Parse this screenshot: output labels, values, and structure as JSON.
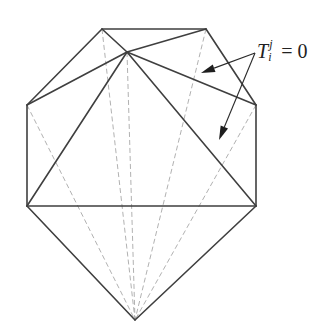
{
  "diagram": {
    "label": {
      "symbol": "T",
      "subscript": "i",
      "superscript": "j",
      "relation": "= 0",
      "full_text": "T_i^j = 0"
    },
    "vertices": {
      "top_left": [
        102,
        29
      ],
      "top_right": [
        206,
        29
      ],
      "apex": [
        127,
        52
      ],
      "left_upper": [
        27,
        105
      ],
      "right_upper": [
        256,
        105
      ],
      "left_lower": [
        27,
        206
      ],
      "right_lower": [
        256,
        206
      ],
      "bottom": [
        135,
        320
      ]
    },
    "solid_edges": [
      [
        "top_left",
        "top_right"
      ],
      [
        "top_left",
        "left_upper"
      ],
      [
        "top_right",
        "right_upper"
      ],
      [
        "top_left",
        "apex"
      ],
      [
        "top_right",
        "apex"
      ],
      [
        "apex",
        "left_upper"
      ],
      [
        "apex",
        "right_upper"
      ],
      [
        "apex",
        "left_lower"
      ],
      [
        "apex",
        "right_lower"
      ],
      [
        "left_upper",
        "left_lower"
      ],
      [
        "right_upper",
        "right_lower"
      ],
      [
        "left_lower",
        "right_lower"
      ],
      [
        "left_lower",
        "bottom"
      ],
      [
        "right_lower",
        "bottom"
      ]
    ],
    "dashed_edges": [
      [
        "left_upper",
        "bottom"
      ],
      [
        "top_left",
        "bottom"
      ],
      [
        "apex",
        "bottom"
      ],
      [
        "top_right",
        "bottom"
      ],
      [
        "right_upper",
        "bottom"
      ]
    ],
    "arrows": [
      {
        "from": [
          255,
          53
        ],
        "to": [
          201,
          73
        ]
      },
      {
        "from": [
          255,
          53
        ],
        "to": [
          219,
          140
        ]
      }
    ],
    "colors": {
      "background": "#ffffff",
      "solid_stroke": "#3f3f3f",
      "dashed_stroke": "#a8a8a8",
      "arrow": "#1e1e1e"
    }
  }
}
